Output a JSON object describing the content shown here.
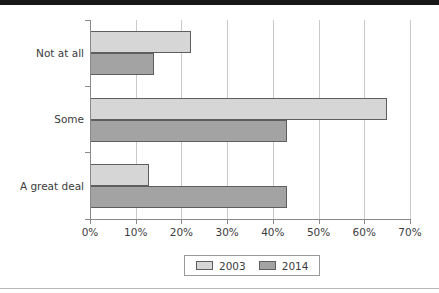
{
  "chart_data": {
    "type": "bar",
    "orientation": "horizontal",
    "title": "",
    "xlabel": "",
    "ylabel": "",
    "categories": [
      "A great deal",
      "Some",
      "Not at all"
    ],
    "series": [
      {
        "name": "2003",
        "color": "#d6d6d6",
        "values": [
          13,
          65,
          22
        ]
      },
      {
        "name": "2014",
        "color": "#a3a3a3",
        "values": [
          43,
          43,
          14
        ]
      }
    ],
    "xlim": [
      0,
      70
    ],
    "xticks": [
      0,
      10,
      20,
      30,
      40,
      50,
      60,
      70
    ],
    "xticklabels": [
      "0%",
      "10%",
      "20%",
      "30%",
      "40%",
      "50%",
      "60%",
      "70%"
    ],
    "grid": "vertical",
    "legend_position": "bottom",
    "value_suffix": "%"
  },
  "legend": {
    "entries": [
      {
        "label": "2003"
      },
      {
        "label": "2014"
      }
    ]
  },
  "axis": {
    "category_labels": [
      "Not at all",
      "Some",
      "A great deal"
    ],
    "x_tick_labels": [
      "0%",
      "10%",
      "20%",
      "30%",
      "40%",
      "50%",
      "60%",
      "70%"
    ]
  }
}
